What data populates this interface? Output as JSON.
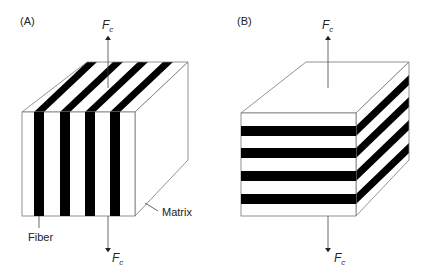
{
  "panels": [
    {
      "id": "A",
      "label": "(A)",
      "force_top": {
        "symbol": "F",
        "subscript": "c"
      },
      "force_bottom": {
        "symbol": "F",
        "subscript": "c"
      },
      "fiber_orientation": "vertical (parallel to load)",
      "callouts": {
        "fiber": "Fiber",
        "matrix": "Matrix"
      }
    },
    {
      "id": "B",
      "label": "(B)",
      "force_top": {
        "symbol": "F",
        "subscript": "c"
      },
      "force_bottom": {
        "symbol": "F",
        "subscript": "c"
      },
      "fiber_orientation": "horizontal (perpendicular to load)"
    }
  ],
  "colors": {
    "fiber": "#000000",
    "matrix": "#ffffff",
    "outline": "#777777",
    "arrow": "#444444"
  }
}
